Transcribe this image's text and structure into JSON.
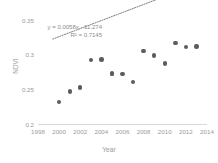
{
  "chart_data": {
    "type": "scatter",
    "title": "",
    "xlabel": "Year",
    "ylabel": "NDVI",
    "xlim": [
      1998,
      2014
    ],
    "ylim": [
      0.2,
      0.35
    ],
    "grid": false,
    "legend": "none",
    "x_ticks": [
      1998,
      2000,
      2002,
      2004,
      2006,
      2008,
      2010,
      2012,
      2014
    ],
    "x_tick_labels": [
      "1998",
      "2000",
      "2002",
      "2004",
      "2006",
      "2008",
      "2010",
      "2012",
      "2014"
    ],
    "y_ticks": [
      0.2,
      0.25,
      0.3,
      0.35
    ],
    "y_tick_labels": [
      "0.2",
      "0.25",
      "0.3",
      "0.35"
    ],
    "series": [
      {
        "name": "NDVI",
        "marker": "circle",
        "color": "#5b5b63",
        "x": [
          2000,
          2001,
          2002,
          2002,
          2003,
          2004,
          2005,
          2005,
          2006,
          2007,
          2008,
          2009,
          2010,
          2011,
          2012,
          2013
        ],
        "y": [
          0.232,
          0.247,
          0.252,
          0.253,
          0.292,
          0.293,
          0.272,
          0.273,
          0.272,
          0.261,
          0.305,
          0.299,
          0.287,
          0.317,
          0.311,
          0.312
        ]
      }
    ],
    "trendline": {
      "type": "linear",
      "equation": "y = 0.0058x - 11.274",
      "r_squared_label": "R² = 0.7145",
      "r_squared": 0.7145,
      "slope": 0.0058,
      "intercept": -11.274,
      "style": "dotted",
      "color": "#6f6f6f",
      "x_start": 1999.4,
      "x_end": 2013.9
    },
    "annotations": [
      {
        "name": "equation-label",
        "text": "y = 0.0058x - 11.274"
      },
      {
        "name": "r-squared-label",
        "text": "R² = 0.7145"
      }
    ]
  },
  "axes": {
    "x_title": "Year",
    "y_title": "NDVI"
  },
  "colors": {
    "marker": "#5b5b63",
    "trendline": "#6f6f6f",
    "axis": "#d9d9d9",
    "tick_text": "#9b9b9b",
    "annotation_text": "#8d8d8d",
    "background": "#ffffff"
  }
}
